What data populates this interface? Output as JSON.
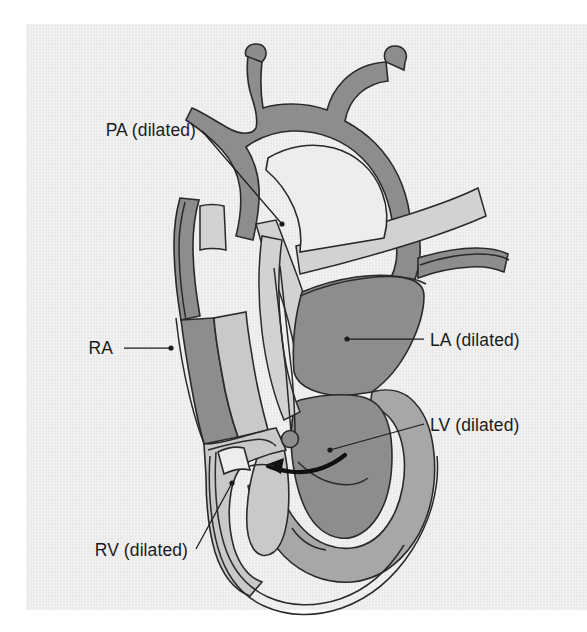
{
  "figure": {
    "kind": "anatomical-heart-cross-section",
    "background_color": "#ededed",
    "page_color": "#ffffff",
    "outline_color": "#2a2a2a",
    "palette": {
      "wall_dark": "#8d8d8d",
      "wall_mid": "#a7a7a7",
      "lumen": "#c9c9c9",
      "lumen_light": "#d2d2d2",
      "label_text": "#1b1b1b"
    }
  },
  "labels": [
    {
      "id": "pa",
      "text": "PA (dilated)",
      "anchor": "end",
      "text_x": 196,
      "text_y": 136,
      "leader": "M 202,131 L 282,224",
      "dot_x": 282,
      "dot_y": 224
    },
    {
      "id": "ra",
      "text": "RA",
      "anchor": "end",
      "text_x": 113,
      "text_y": 354,
      "leader": "M 124,348 L 171,348",
      "dot_x": 171,
      "dot_y": 348
    },
    {
      "id": "rv",
      "text": "RV (dilated)",
      "anchor": "end",
      "text_x": 188,
      "text_y": 556,
      "leader": "M 196,549 L 232,483",
      "dot_x": 232,
      "dot_y": 483
    },
    {
      "id": "la",
      "text": "LA (dilated)",
      "anchor": "start",
      "text_x": 430,
      "text_y": 346,
      "leader": "M 424,339 L 347,339",
      "dot_x": 347,
      "dot_y": 339
    },
    {
      "id": "lv",
      "text": "LV (dilated)",
      "anchor": "start",
      "text_x": 430,
      "text_y": 431,
      "leader": "M 424,424 L 330,450",
      "dot_x": 330,
      "dot_y": 450
    }
  ],
  "annotations": [
    {
      "id": "shunt-arrow",
      "kind": "curved-arrow",
      "direction": "right-to-left",
      "meaning": "shunt flow"
    },
    {
      "id": "septal-defect-marker",
      "kind": "filled-circle",
      "cx": 290,
      "cy": 439,
      "r": 8
    }
  ]
}
